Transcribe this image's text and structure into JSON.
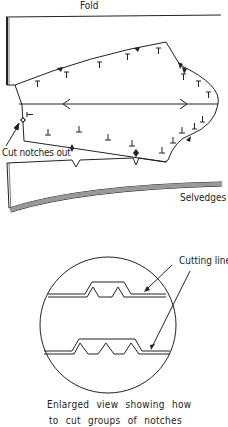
{
  "diagram": {
    "labels": {
      "fold": "Fold",
      "cut_notches": "Cut notches out",
      "selvedges": "Selvedges",
      "cutting_line": "Cutting line"
    },
    "caption": {
      "line1": "Enlarged view showing how",
      "line2": "to cut groups of notches"
    },
    "colors": {
      "line": "#222222",
      "background": "#ffffff",
      "selvedge_fill": "#888888"
    },
    "enlarged_view": {
      "top_notch_group_count": 2,
      "bottom_notch_group_count": 3
    }
  }
}
